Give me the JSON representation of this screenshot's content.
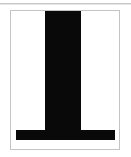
{
  "image": {
    "width": 131,
    "height": 157,
    "background_color": "#ffffff",
    "caption": "Bold black perpendicular glyph on a bordered white tile"
  },
  "top_rule": {
    "name": "top-divider",
    "color": "#c9c9c9",
    "thickness_px": 1
  },
  "card": {
    "name": "glyph-tile",
    "background_color": "#ffffff",
    "border_color": "#c4c4c4",
    "border_px": 1,
    "left": 10,
    "top": 10,
    "width": 110,
    "height": 140
  },
  "glyph": {
    "character": "⊥",
    "description": "thick vertical stem meeting a wide horizontal base bar",
    "fill_color": "#090909",
    "stem": {
      "left": 45,
      "top": 11,
      "width": 36,
      "height": 119
    },
    "foot": {
      "left": 16,
      "top": 130,
      "width": 99,
      "height": 10
    }
  }
}
